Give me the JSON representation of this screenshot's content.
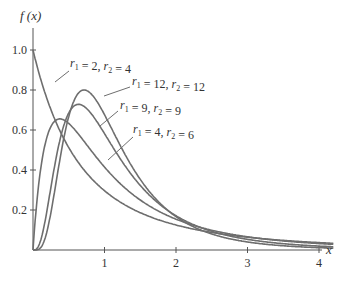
{
  "chart_data": {
    "type": "line",
    "title": "",
    "xlabel": "x",
    "ylabel": "f (x)",
    "xlim": [
      0,
      4.2
    ],
    "ylim": [
      0,
      1.05
    ],
    "grid": false,
    "x_ticks": [
      "1",
      "2",
      "3",
      "4"
    ],
    "y_ticks": [
      "0.2",
      "0.4",
      "0.6",
      "0.8",
      "1.0"
    ],
    "series": [
      {
        "name": "r1 = 2, r2 = 4",
        "r1": 2,
        "r2": 4,
        "peak": {
          "x": 0,
          "y": 1.0
        }
      },
      {
        "name": "r1 = 12, r2 = 12",
        "r1": 12,
        "r2": 12,
        "peak": {
          "x": 0.71,
          "y": 0.8
        }
      },
      {
        "name": "r1 = 9, r2 = 9",
        "r1": 9,
        "r2": 9,
        "peak": {
          "x": 0.64,
          "y": 0.73
        }
      },
      {
        "name": "r1 = 4, r2 = 6",
        "r1": 4,
        "r2": 6,
        "peak": {
          "x": 0.38,
          "y": 0.65
        }
      }
    ],
    "annotations": [
      {
        "sub1": "1",
        "v1": "2",
        "sub2": "2",
        "v2": "4"
      },
      {
        "sub1": "1",
        "v1": "12",
        "sub2": "2",
        "v2": "12"
      },
      {
        "sub1": "1",
        "v1": "9",
        "sub2": "2",
        "v2": "9"
      },
      {
        "sub1": "1",
        "v1": "4",
        "sub2": "2",
        "v2": "6"
      }
    ]
  },
  "colors": {
    "curve": "#6e6e6e",
    "axis": "#555555",
    "text": "#333333"
  }
}
